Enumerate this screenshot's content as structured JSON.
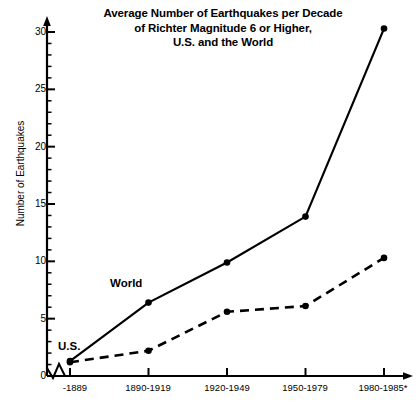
{
  "chart_data": {
    "type": "line",
    "title": "Average Number of Earthquakes per Decade of Richter Magnitude 6 or Higher, U.S. and the World",
    "title_lines": [
      "Average Number of Earthquakes per Decade",
      "of Richter Magnitude 6 or Higher,",
      "U.S. and the World"
    ],
    "xlabel": "",
    "ylabel": "Number of Earthquakes",
    "categories": [
      "-1889",
      "1890-1919",
      "1920-1949",
      "1950-1979",
      "1980-1985*"
    ],
    "series": [
      {
        "name": "World",
        "style": "solid",
        "marker": "filled-circle",
        "values": [
          1.3,
          6.4,
          9.9,
          13.9,
          30.3
        ]
      },
      {
        "name": "U.S.",
        "style": "dashed",
        "marker": "filled-circle",
        "values": [
          1.2,
          2.2,
          5.6,
          6.1,
          10.3
        ]
      }
    ],
    "ylim": [
      0,
      31
    ],
    "y_major_ticks": [
      0,
      5,
      10,
      15,
      20,
      25,
      30
    ],
    "y_minor_tick_step": 1,
    "y_tick_labels": [
      "0",
      "5",
      "10",
      "15",
      "20",
      "25",
      "30"
    ],
    "grid": false,
    "legend": "inline-series-labels",
    "axis_break_at_origin": true,
    "colors": {
      "line": "#000000",
      "text": "#000000",
      "background": "#ffffff"
    }
  }
}
